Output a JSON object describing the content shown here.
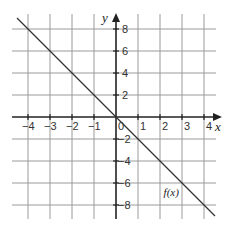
{
  "chart_data": {
    "type": "line",
    "title": "",
    "xlabel": "x",
    "ylabel": "y",
    "xlim": [
      -4.5,
      4.5
    ],
    "ylim": [
      -9,
      9
    ],
    "x_ticks": [
      -4,
      -3,
      -2,
      -1,
      1,
      2,
      3,
      4
    ],
    "x_tick_labels": [
      "−4",
      "−3",
      "−2",
      "−1",
      "1",
      "2",
      "3",
      "4"
    ],
    "y_ticks": [
      8,
      6,
      4,
      2,
      -2,
      -4,
      -6,
      -8
    ],
    "y_tick_labels": [
      "8",
      "6",
      "4",
      "2",
      "−2",
      "−4",
      "−6",
      "−8"
    ],
    "origin_label": "0",
    "grid": true,
    "series": [
      {
        "name": "f(x)",
        "equation": "f(x) = -2x",
        "x": [
          -4.5,
          4.5
        ],
        "y": [
          9,
          -9
        ],
        "color": "#333333"
      }
    ],
    "annotations": [
      {
        "text": "f(x)",
        "x": 2.8,
        "y": -6.8
      }
    ]
  }
}
